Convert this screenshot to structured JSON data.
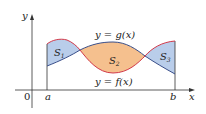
{
  "diagram": {
    "axes": {
      "x_label": "x",
      "y_label": "y",
      "origin_label": "0",
      "a_label": "a",
      "b_label": "b"
    },
    "curves": {
      "g_label": "y = g(x)",
      "f_label": "y = f(x)",
      "f_color": "#d23a4a",
      "g_color": "#3a4f8a"
    },
    "regions": [
      {
        "name": "S",
        "sub": "1",
        "color": "#b9cdea"
      },
      {
        "name": "S",
        "sub": "2",
        "color": "#f5c08e"
      },
      {
        "name": "S",
        "sub": "3",
        "color": "#b9cdea"
      }
    ]
  }
}
